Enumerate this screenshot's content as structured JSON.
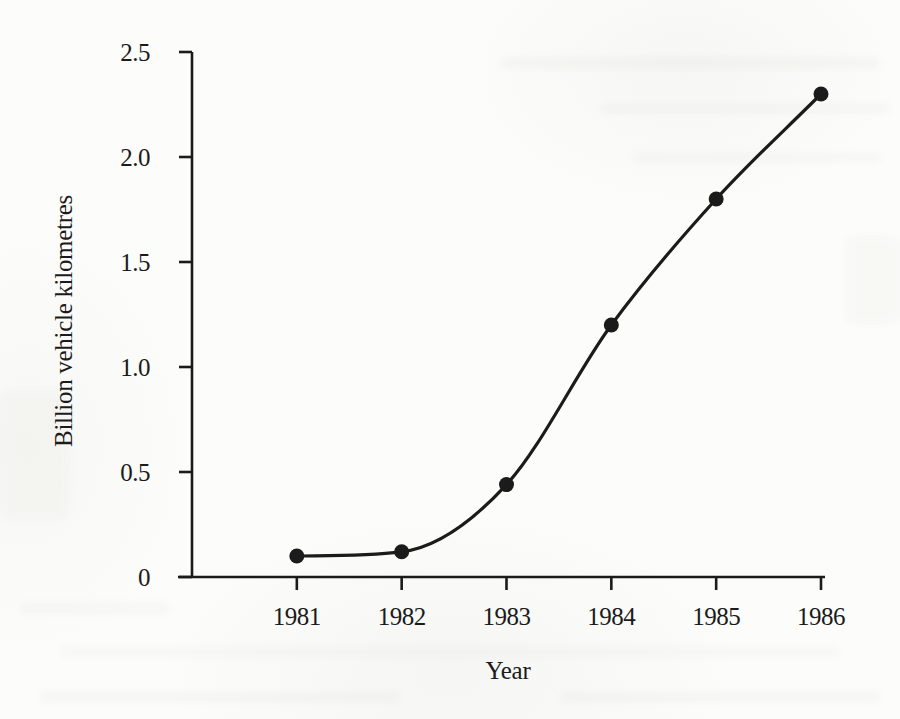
{
  "colors": {
    "ink": "#1b1b1b",
    "paper": "#fcfcfa"
  },
  "chart_data": {
    "type": "line",
    "title": "",
    "xlabel": "Year",
    "ylabel": "Billion vehicle kilometres",
    "x": [
      1981,
      1982,
      1983,
      1984,
      1985,
      1986
    ],
    "values": [
      0.1,
      0.12,
      0.44,
      1.2,
      1.8,
      2.3
    ],
    "xlim": [
      1980,
      1986
    ],
    "ylim": [
      0,
      2.5
    ],
    "x_ticks": [
      {
        "v": 1981,
        "label": "1981"
      },
      {
        "v": 1982,
        "label": "1982"
      },
      {
        "v": 1983,
        "label": "1983"
      },
      {
        "v": 1984,
        "label": "1984"
      },
      {
        "v": 1985,
        "label": "1985"
      },
      {
        "v": 1986,
        "label": "1986"
      }
    ],
    "y_ticks": [
      {
        "v": 0,
        "label": "0"
      },
      {
        "v": 0.5,
        "label": "0.5"
      },
      {
        "v": 1,
        "label": "1.0"
      },
      {
        "v": 1.5,
        "label": "1.5"
      },
      {
        "v": 2,
        "label": "2.0"
      },
      {
        "v": 2.5,
        "label": "2.5"
      }
    ],
    "grid": false,
    "legend": null,
    "marker": "filled-circle",
    "line_style": "solid"
  }
}
